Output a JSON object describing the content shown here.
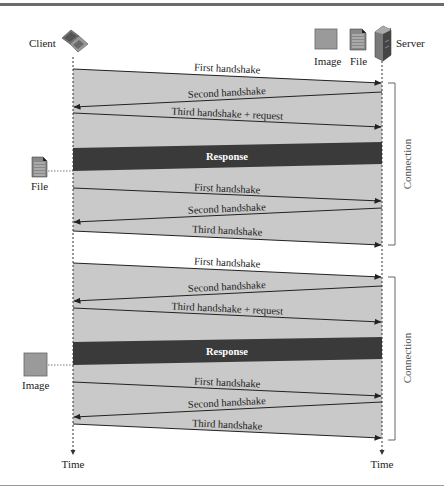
{
  "diagram": {
    "type": "sequence",
    "actors": {
      "client": {
        "label": "Client",
        "icon": "laptop-icon"
      },
      "server": {
        "label": "Server",
        "icon": "server-icon"
      },
      "image_resource": {
        "label": "Image",
        "icon": "image-icon"
      },
      "file_resource": {
        "label": "File",
        "icon": "file-icon"
      }
    },
    "time_labels": {
      "client": "Time",
      "server": "Time"
    },
    "connections": [
      {
        "label": "Connection",
        "retrieved": {
          "label": "File",
          "icon": "file-icon"
        },
        "messages": [
          {
            "label": "First handshake",
            "direction": "client-to-server"
          },
          {
            "label": "Second handshake",
            "direction": "server-to-client"
          },
          {
            "label": "Third handshake + request",
            "direction": "client-to-server"
          },
          {
            "label": "Response",
            "direction": "server-to-client",
            "style": "band"
          },
          {
            "label": "First handshake",
            "direction": "client-to-server"
          },
          {
            "label": "Second handshake",
            "direction": "server-to-client"
          },
          {
            "label": "Third handshake",
            "direction": "client-to-server"
          }
        ]
      },
      {
        "label": "Connection",
        "retrieved": {
          "label": "Image",
          "icon": "image-icon"
        },
        "messages": [
          {
            "label": "First handshake",
            "direction": "client-to-server"
          },
          {
            "label": "Second handshake",
            "direction": "server-to-client"
          },
          {
            "label": "Third handshake + request",
            "direction": "client-to-server"
          },
          {
            "label": "Response",
            "direction": "server-to-client",
            "style": "band"
          },
          {
            "label": "First handshake",
            "direction": "client-to-server"
          },
          {
            "label": "Second handshake",
            "direction": "server-to-client"
          },
          {
            "label": "Third handshake",
            "direction": "client-to-server"
          }
        ]
      }
    ],
    "colors": {
      "region_fill": "#c9c9c9",
      "response_band": "#3a3a3a",
      "arrow": "#222222",
      "rule": "#6b6b6b"
    }
  }
}
